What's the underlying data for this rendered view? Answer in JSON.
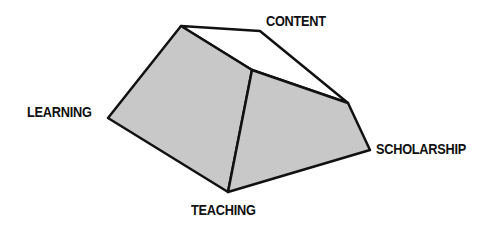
{
  "diagram": {
    "type": "prism-shape",
    "labels": {
      "content": "CONTENT",
      "learning": "LEARNING",
      "scholarship": "SCHOLARSHIP",
      "teaching": "TEACHING"
    },
    "colors": {
      "face_fill": "#c8c8c8",
      "top_face_fill": "#ffffff",
      "stroke": "#111111",
      "label": "#111111"
    }
  }
}
